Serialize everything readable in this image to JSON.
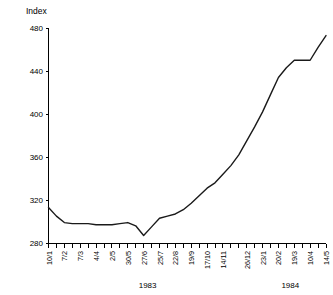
{
  "chart_data": {
    "type": "line",
    "title": "Index",
    "xlabel": "",
    "ylabel": "Index",
    "ylim": [
      280,
      480
    ],
    "yticks": [
      280,
      320,
      360,
      400,
      440,
      480
    ],
    "grid": false,
    "legend": null,
    "x": [
      "10/1",
      "24/1",
      "7/2",
      "21/2",
      "7/3",
      "21/3",
      "4/4",
      "18/4",
      "2/5",
      "16/5",
      "30/5",
      "13/6",
      "27/6",
      "11/7",
      "25/7",
      "8/8",
      "22/8",
      "5/9",
      "19/9",
      "3/10",
      "17/10",
      "31/10",
      "14/11",
      "28/11",
      "12/12",
      "26/12",
      "9/1",
      "23/1",
      "6/2",
      "20/2",
      "5/3",
      "19/3",
      "2/4",
      "10/4",
      "30/4",
      "14/5"
    ],
    "xtick_labels": [
      "10/1",
      "7/2",
      "7/3",
      "4/4",
      "2/5",
      "30/5",
      "27/6",
      "25/7",
      "22/8",
      "19/9",
      "17/10",
      "14/11",
      "26/12",
      "23/1",
      "20/2",
      "19/3",
      "10/4",
      "14/5"
    ],
    "values": [
      313,
      305,
      299,
      298,
      298,
      298,
      297,
      297,
      297,
      298,
      299,
      296,
      287,
      295,
      303,
      305,
      307,
      311,
      317,
      324,
      331,
      336,
      344,
      352,
      362,
      375,
      388,
      402,
      418,
      434,
      443,
      450,
      450,
      450,
      462,
      473
    ],
    "year_groups": [
      {
        "label": "1983",
        "start": "10/1",
        "end": "26/12"
      },
      {
        "label": "1984",
        "start": "9/1",
        "end": "14/5"
      }
    ],
    "annotations": []
  },
  "axes": {
    "y_axis_title": "Index",
    "year_1983": "1983",
    "year_1984": "1984"
  }
}
